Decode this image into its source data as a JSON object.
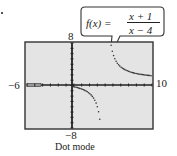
{
  "callout": {
    "lhs": "f(x) =",
    "numerator": "x + 1",
    "denominator": "x − 4"
  },
  "axes": {
    "ymax_label": "8",
    "ymin_label": "−8",
    "xmin_label": "−6",
    "xmax_label": "10"
  },
  "caption": "Dot mode",
  "chart_data": {
    "type": "scatter",
    "subtitle": "Dot mode",
    "xlabel": "",
    "ylabel": "",
    "xlim": [
      -6,
      10
    ],
    "ylim": [
      -8,
      8
    ],
    "grid": false,
    "vertical_asymptote": 4,
    "horizontal_asymptote": 1,
    "series": [
      {
        "name": "f(x)",
        "x": [
          -6,
          -5,
          -4,
          -3,
          -2,
          -1,
          0,
          0.5,
          1,
          1.5,
          2,
          2.5,
          3,
          3.3,
          3.5,
          4.5,
          4.7,
          5,
          5.5,
          6,
          6.5,
          7,
          7.5,
          8,
          8.5,
          9,
          9.5,
          10
        ],
        "y": [
          0.5,
          0.44,
          0.38,
          0.29,
          0.17,
          0,
          -0.25,
          -0.43,
          -0.67,
          -1,
          -1.5,
          -2.33,
          -4,
          -6.14,
          -9,
          11,
          7.71,
          6,
          4.33,
          3.5,
          3,
          2.67,
          2.43,
          2.25,
          2.11,
          2,
          1.91,
          1.83
        ]
      }
    ]
  }
}
